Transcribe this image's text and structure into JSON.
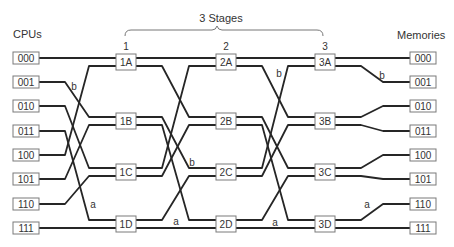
{
  "header": {
    "left_label": "CPUs",
    "right_label": "Memories",
    "stages_title": "3 Stages"
  },
  "stages": [
    {
      "number": "1",
      "switches": [
        "1A",
        "1B",
        "1C",
        "1D"
      ]
    },
    {
      "number": "2",
      "switches": [
        "2A",
        "2B",
        "2C",
        "2D"
      ]
    },
    {
      "number": "3",
      "switches": [
        "3A",
        "3B",
        "3C",
        "3D"
      ]
    }
  ],
  "cpus": [
    "000",
    "001",
    "010",
    "011",
    "100",
    "101",
    "110",
    "111"
  ],
  "memories": [
    "000",
    "001",
    "010",
    "011",
    "100",
    "101",
    "110",
    "111"
  ],
  "links": [
    {
      "from_column": "cpus",
      "to_column": "stage-1",
      "map": [
        0,
        2,
        4,
        6,
        1,
        3,
        5,
        7
      ]
    },
    {
      "from_column": "stage-1",
      "to_column": "stage-2",
      "map": [
        0,
        2,
        4,
        6,
        1,
        3,
        5,
        7
      ]
    },
    {
      "from_column": "stage-2",
      "to_column": "stage-3",
      "map": [
        0,
        2,
        4,
        6,
        1,
        3,
        5,
        7
      ]
    },
    {
      "from_column": "stage-3",
      "to_column": "memories",
      "map": [
        0,
        1,
        2,
        3,
        4,
        5,
        6,
        7
      ]
    }
  ],
  "wire_labels": [
    {
      "text": "b"
    },
    {
      "text": "a"
    },
    {
      "text": "b"
    },
    {
      "text": "a"
    },
    {
      "text": "b"
    },
    {
      "text": "a"
    },
    {
      "text": "b"
    },
    {
      "text": "a"
    }
  ],
  "colors": {
    "wire": "#262626",
    "box_border": "#7a7a7a",
    "text": "#333333",
    "background": "#ffffff"
  }
}
